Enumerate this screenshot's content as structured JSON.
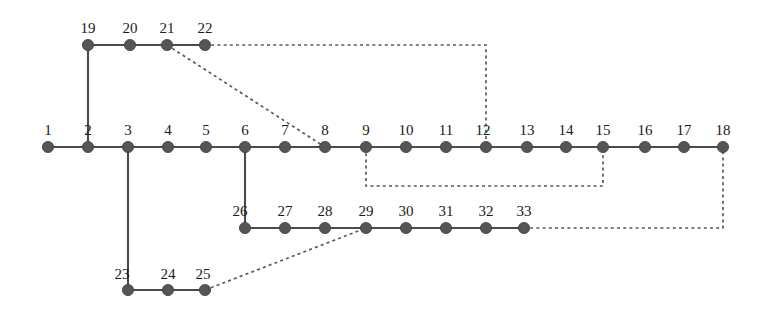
{
  "diagram": {
    "type": "node-link-graph",
    "width": 767,
    "height": 310,
    "background_color": "#ffffff",
    "node_color": "#555555",
    "solid_edge_color": "#4a4a4a",
    "dashed_edge_color": "#5a5a5a",
    "node_radius": 5.6,
    "label_font_size": 15,
    "nodes": [
      {
        "id": "1",
        "label": "1",
        "x": 48,
        "y": 147,
        "label_x": 48,
        "label_y": 135
      },
      {
        "id": "2",
        "label": "2",
        "x": 88,
        "y": 147,
        "label_x": 88,
        "label_y": 135
      },
      {
        "id": "3",
        "label": "3",
        "x": 128,
        "y": 147,
        "label_x": 128,
        "label_y": 135
      },
      {
        "id": "4",
        "label": "4",
        "x": 168,
        "y": 147,
        "label_x": 168,
        "label_y": 135
      },
      {
        "id": "5",
        "label": "5",
        "x": 206,
        "y": 147,
        "label_x": 206,
        "label_y": 135
      },
      {
        "id": "6",
        "label": "6",
        "x": 245,
        "y": 147,
        "label_x": 245,
        "label_y": 135
      },
      {
        "id": "7",
        "label": "7",
        "x": 285,
        "y": 147,
        "label_x": 285,
        "label_y": 135
      },
      {
        "id": "8",
        "label": "8",
        "x": 325,
        "y": 147,
        "label_x": 325,
        "label_y": 135
      },
      {
        "id": "9",
        "label": "9",
        "x": 366,
        "y": 147,
        "label_x": 366,
        "label_y": 135
      },
      {
        "id": "10",
        "label": "10",
        "x": 406,
        "y": 147,
        "label_x": 406,
        "label_y": 135
      },
      {
        "id": "11",
        "label": "11",
        "x": 446,
        "y": 147,
        "label_x": 446,
        "label_y": 135
      },
      {
        "id": "12",
        "label": "12",
        "x": 486,
        "y": 147,
        "label_x": 483,
        "label_y": 135
      },
      {
        "id": "13",
        "label": "13",
        "x": 527,
        "y": 147,
        "label_x": 527,
        "label_y": 135
      },
      {
        "id": "14",
        "label": "14",
        "x": 566,
        "y": 147,
        "label_x": 566,
        "label_y": 135
      },
      {
        "id": "15",
        "label": "15",
        "x": 603,
        "y": 147,
        "label_x": 603,
        "label_y": 135
      },
      {
        "id": "16",
        "label": "16",
        "x": 645,
        "y": 147,
        "label_x": 645,
        "label_y": 135
      },
      {
        "id": "17",
        "label": "17",
        "x": 684,
        "y": 147,
        "label_x": 684,
        "label_y": 135
      },
      {
        "id": "18",
        "label": "18",
        "x": 723,
        "y": 147,
        "label_x": 723,
        "label_y": 135
      },
      {
        "id": "19",
        "label": "19",
        "x": 88,
        "y": 45,
        "label_x": 88,
        "label_y": 33
      },
      {
        "id": "20",
        "label": "20",
        "x": 130,
        "y": 45,
        "label_x": 130,
        "label_y": 33
      },
      {
        "id": "21",
        "label": "21",
        "x": 167,
        "y": 45,
        "label_x": 167,
        "label_y": 33
      },
      {
        "id": "22",
        "label": "22",
        "x": 205,
        "y": 45,
        "label_x": 205,
        "label_y": 33
      },
      {
        "id": "23",
        "label": "23",
        "x": 128,
        "y": 290,
        "label_x": 122,
        "label_y": 279
      },
      {
        "id": "24",
        "label": "24",
        "x": 168,
        "y": 290,
        "label_x": 168,
        "label_y": 279
      },
      {
        "id": "25",
        "label": "25",
        "x": 205,
        "y": 290,
        "label_x": 203,
        "label_y": 279
      },
      {
        "id": "26",
        "label": "26",
        "x": 245,
        "y": 228,
        "label_x": 240,
        "label_y": 216
      },
      {
        "id": "27",
        "label": "27",
        "x": 285,
        "y": 228,
        "label_x": 285,
        "label_y": 216
      },
      {
        "id": "28",
        "label": "28",
        "x": 325,
        "y": 228,
        "label_x": 325,
        "label_y": 216
      },
      {
        "id": "29",
        "label": "29",
        "x": 366,
        "y": 228,
        "label_x": 366,
        "label_y": 216
      },
      {
        "id": "30",
        "label": "30",
        "x": 406,
        "y": 228,
        "label_x": 406,
        "label_y": 216
      },
      {
        "id": "31",
        "label": "31",
        "x": 446,
        "y": 228,
        "label_x": 446,
        "label_y": 216
      },
      {
        "id": "32",
        "label": "32",
        "x": 486,
        "y": 228,
        "label_x": 486,
        "label_y": 216
      },
      {
        "id": "33",
        "label": "33",
        "x": 524,
        "y": 228,
        "label_x": 524,
        "label_y": 216
      }
    ],
    "solid_edges": [
      {
        "name": "main-line-1-18",
        "from": "1",
        "to": "18",
        "points": "48,147 723,147"
      },
      {
        "name": "top-line-19-22",
        "from": "19",
        "to": "22",
        "points": "88,45 205,45"
      },
      {
        "name": "branch-2-19",
        "from": "2",
        "to": "19",
        "points": "88,147 88,45"
      },
      {
        "name": "branch-3-23",
        "from": "3",
        "to": "23",
        "points": "128,147 128,290"
      },
      {
        "name": "bottom-line-23-25",
        "from": "23",
        "to": "25",
        "points": "128,290 205,290"
      },
      {
        "name": "branch-6-26",
        "from": "6",
        "to": "26",
        "points": "245,147 245,228"
      },
      {
        "name": "lower-line-26-33",
        "from": "26",
        "to": "33",
        "points": "245,228 524,228"
      }
    ],
    "dashed_edges": [
      {
        "name": "link-21-8",
        "from": "21",
        "to": "8",
        "points": "167,45 325,147"
      },
      {
        "name": "link-22-12",
        "from": "22",
        "to": "12",
        "points": "205,45 486,45 486,147"
      },
      {
        "name": "link-9-15",
        "from": "9",
        "to": "15",
        "points": "366,147 366,186 603,186 603,147"
      },
      {
        "name": "link-25-29",
        "from": "25",
        "to": "29",
        "points": "205,290 366,228"
      },
      {
        "name": "link-33-18",
        "from": "33",
        "to": "18",
        "points": "524,228 723,228 723,147"
      }
    ]
  }
}
